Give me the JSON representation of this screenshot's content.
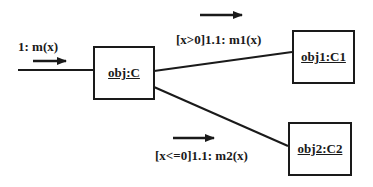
{
  "diagram": {
    "type": "collaboration-diagram",
    "objects": [
      {
        "id": "obj",
        "label": "obj:C"
      },
      {
        "id": "obj1",
        "label": "obj1:C1"
      },
      {
        "id": "obj2",
        "label": "obj2:C2"
      }
    ],
    "messages": [
      {
        "label": "1: m(x)",
        "from": "external",
        "to": "obj"
      },
      {
        "label": "[x>0]1.1: m1(x)",
        "from": "obj",
        "to": "obj1"
      },
      {
        "label": "[x<=0]1.1: m2(x)",
        "from": "obj",
        "to": "obj2"
      }
    ],
    "colors": {
      "stroke": "#1a1a1a",
      "background": "#ffffff"
    }
  }
}
